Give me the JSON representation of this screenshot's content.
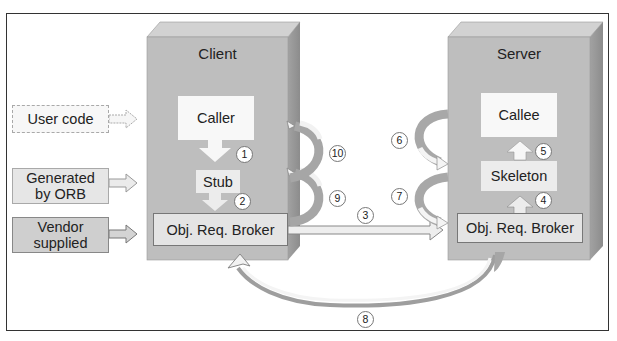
{
  "legend": {
    "items": [
      {
        "label_line1": "User code",
        "label_line2": "",
        "kind": "user"
      },
      {
        "label_line1": "Generated",
        "label_line2": "by ORB",
        "kind": "generated"
      },
      {
        "label_line1": "Vendor",
        "label_line2": "supplied",
        "kind": "vendor"
      }
    ]
  },
  "client": {
    "title": "Client",
    "caller": "Caller",
    "stub": "Stub",
    "orb": "Obj. Req. Broker"
  },
  "server": {
    "title": "Server",
    "callee": "Callee",
    "skeleton": "Skeleton",
    "orb": "Obj. Req. Broker"
  },
  "steps": [
    "1",
    "2",
    "3",
    "4",
    "5",
    "6",
    "7",
    "8",
    "9",
    "10"
  ],
  "colors": {
    "machine_front": "#bdbdbd",
    "machine_top": "#d0d0d0",
    "machine_side": "#9a9a9a",
    "arrow_light": "#f2f2f2",
    "arrow_dark": "#a8a8a8",
    "frame": "#333333"
  }
}
